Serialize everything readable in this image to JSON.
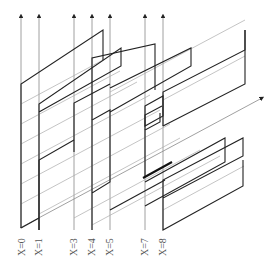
{
  "diagram": {
    "type": "isometric panel stack",
    "labels": [
      "X=0",
      "X=1",
      "X=3",
      "X=4",
      "X=5",
      "X=7",
      "X=8"
    ],
    "columns": [
      {
        "label": "X=0",
        "x": 21
      },
      {
        "label": "X=1",
        "x": 39
      },
      {
        "label": "X=3",
        "x": 74
      },
      {
        "label": "X=4",
        "x": 92
      },
      {
        "label": "X=5",
        "x": 110
      },
      {
        "label": "X=7",
        "x": 145
      },
      {
        "label": "X=8",
        "x": 163
      }
    ],
    "colors": {
      "stroke_dark": "#222222",
      "stroke_light": "#9a9a9a",
      "background": "#ffffff"
    }
  }
}
